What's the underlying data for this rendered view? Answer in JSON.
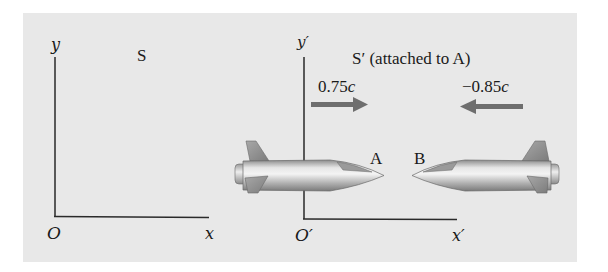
{
  "figure": {
    "frame_s": {
      "name": "S",
      "y_axis_label": "y",
      "x_axis_label": "x",
      "origin_label": "O"
    },
    "frame_s_prime": {
      "name": "S′ (attached to A)",
      "y_axis_label": "y′",
      "x_axis_label": "x′",
      "origin_label": "O′"
    },
    "rocket_a": {
      "label": "A",
      "velocity_label": "0.75",
      "velocity_unit": "c",
      "direction": "right"
    },
    "rocket_b": {
      "label": "B",
      "velocity_label": "−0.85",
      "velocity_unit": "c",
      "direction": "left"
    },
    "colors": {
      "panel_background": "#e8e8e8",
      "axis_line": "#2a2a2a",
      "arrow": "#6e6e6e",
      "rocket_body": "#c8c8c8",
      "rocket_fin": "#9a9a9a"
    }
  }
}
